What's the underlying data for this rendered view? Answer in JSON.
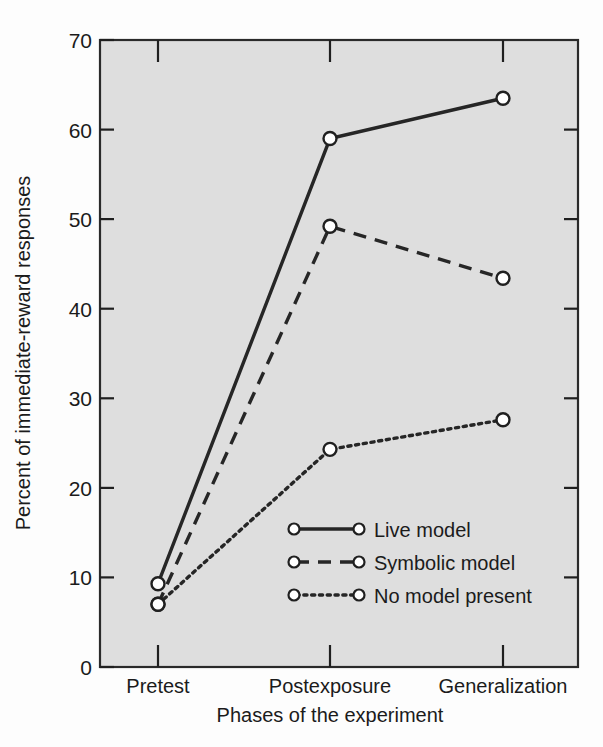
{
  "chart_data": {
    "type": "line",
    "title": "",
    "xlabel": "Phases of the experiment",
    "ylabel": "Percent of immediate-reward responses",
    "categories": [
      "Pretest",
      "Postexposure",
      "Generalization"
    ],
    "ylim": [
      0,
      70
    ],
    "yticks": [
      0,
      10,
      20,
      30,
      40,
      50,
      60,
      70
    ],
    "ytick_labels": [
      "0",
      "10",
      "20",
      "30",
      "40",
      "50",
      "60",
      "70"
    ],
    "grid": false,
    "legend_position": "inside-lower-center",
    "series": [
      {
        "name": "Live model",
        "style": "solid",
        "marker": "open-circle",
        "values": [
          9.3,
          59.0,
          63.5
        ]
      },
      {
        "name": "Symbolic model",
        "style": "dashed",
        "marker": "open-circle",
        "values": [
          7.0,
          49.2,
          43.4
        ]
      },
      {
        "name": "No model present",
        "style": "dotted",
        "marker": "open-circle",
        "values": [
          7.0,
          24.3,
          27.6
        ]
      }
    ]
  },
  "axes": {
    "y_title": "Percent of immediate-reward responses",
    "x_title": "Phases of the experiment",
    "y_tick_0": "0",
    "y_tick_1": "10",
    "y_tick_2": "20",
    "y_tick_3": "30",
    "y_tick_4": "40",
    "y_tick_5": "50",
    "y_tick_6": "60",
    "y_tick_7": "70",
    "x_cat_0": "Pretest",
    "x_cat_1": "Postexposure",
    "x_cat_2": "Generalization"
  },
  "legend": {
    "entries": [
      {
        "label": "Live model",
        "style": "solid"
      },
      {
        "label": "Symbolic model",
        "style": "dashed"
      },
      {
        "label": "No model present",
        "style": "dotted"
      }
    ],
    "label_0": "Live model",
    "label_1": "Symbolic model",
    "label_2": "No model present"
  },
  "colors": {
    "plot_background": "#dedede",
    "page_background": "#fdfdfd",
    "line": "#262626",
    "marker_fill": "#ffffff",
    "text": "#1b1b1b"
  }
}
